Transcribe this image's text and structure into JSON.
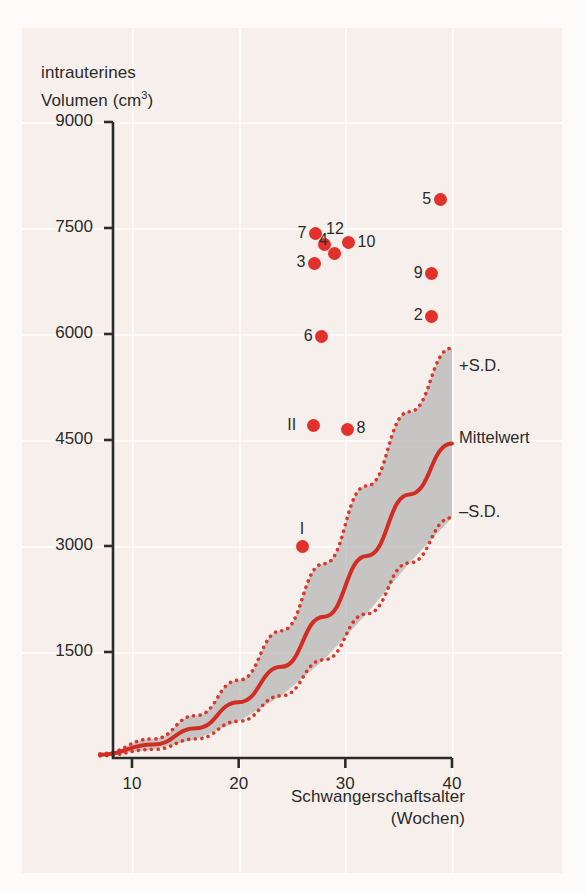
{
  "chart_data": {
    "type": "scatter",
    "title": "",
    "xlabel": "Schwangerschaftsalter\n(Wochen)",
    "xlabel_line1": "Schwangerschaftsalter",
    "xlabel_line2": "(Wochen)",
    "ylabel_line1": "intrauterines",
    "ylabel_line2": "Volumen (cm",
    "ylabel_sup": "3",
    "ylabel_line2_end": ")",
    "xlim": [
      7,
      40
    ],
    "ylim": [
      0,
      9000
    ],
    "xticks": [
      10,
      20,
      30,
      40
    ],
    "yticks": [
      1500,
      3000,
      4500,
      6000,
      7500,
      9000
    ],
    "grid": true,
    "legend_position": "right-inline",
    "colors": {
      "point": "#e3302a",
      "mean_line": "#d22d23",
      "sd_line": "#d9392c",
      "band_fill": "#b7b7b7",
      "background": "#f7efec",
      "axis": "#2b2b2b",
      "gridline": "#ffffff"
    },
    "annotations": [
      {
        "name": "plus-sd",
        "text": "+S.D."
      },
      {
        "name": "mean",
        "text": "Mittelwert"
      },
      {
        "name": "minus-sd",
        "text": "–S.D."
      }
    ],
    "points": [
      {
        "label": "5",
        "x": 38.9,
        "y": 7900
      },
      {
        "label": "7",
        "x": 27.2,
        "y": 7420
      },
      {
        "label": "12",
        "x": 28.0,
        "y": 7270
      },
      {
        "label": "10",
        "x": 30.3,
        "y": 7290
      },
      {
        "label": "3",
        "x": 27.1,
        "y": 7000
      },
      {
        "label": "4",
        "x": 29.0,
        "y": 7140
      },
      {
        "label": "9",
        "x": 38.1,
        "y": 6850
      },
      {
        "label": "2",
        "x": 38.1,
        "y": 6250
      },
      {
        "label": "6",
        "x": 27.8,
        "y": 5960
      },
      {
        "label": "II",
        "x": 27.0,
        "y": 4700
      },
      {
        "label": "8",
        "x": 30.2,
        "y": 4650
      },
      {
        "label": "I",
        "x": 26.0,
        "y": 3000
      }
    ],
    "series": [
      {
        "name": "+S.D.",
        "style": "dotted",
        "x": [
          7,
          12,
          16,
          20,
          24,
          28,
          32,
          36,
          40
        ],
        "y": [
          60,
          270,
          600,
          1100,
          1800,
          2750,
          3850,
          4900,
          5800
        ]
      },
      {
        "name": "Mittelwert",
        "style": "solid",
        "x": [
          7,
          12,
          16,
          20,
          24,
          28,
          32,
          36,
          40
        ],
        "y": [
          45,
          190,
          420,
          790,
          1290,
          2000,
          2860,
          3730,
          4450
        ]
      },
      {
        "name": "–S.D.",
        "style": "dotted",
        "x": [
          7,
          12,
          16,
          20,
          24,
          28,
          32,
          36,
          40
        ],
        "y": [
          30,
          120,
          270,
          520,
          880,
          1390,
          2040,
          2760,
          3400
        ]
      }
    ]
  }
}
